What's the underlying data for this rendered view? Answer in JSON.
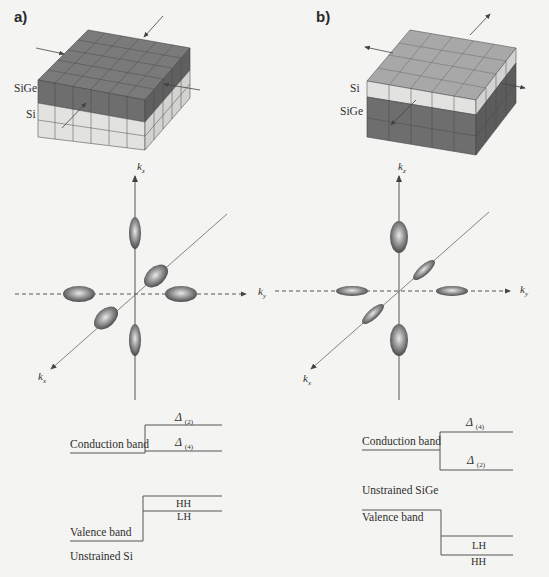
{
  "figure": {
    "panels": [
      {
        "id": "a",
        "label": "a)",
        "structure": {
          "layers_top_to_bottom": [
            "SiGe",
            "Si"
          ],
          "layer_labels": {
            "upper": "SiGe",
            "lower": "Si"
          },
          "strain_arrows": "compressive (pointing inward)"
        },
        "k_space": {
          "axes": {
            "kz": "k",
            "kz_sub": "z",
            "ky": "k",
            "ky_sub": "y",
            "kx": "k",
            "kx_sub": "x"
          },
          "valleys": {
            "kz": "small (elongated along kz)",
            "kx_ky": "large (in-plane)"
          }
        },
        "bands": {
          "conduction_label": "Conduction band",
          "delta_upper": {
            "symbol": "Δ",
            "sub": "(2)"
          },
          "delta_lower": {
            "symbol": "Δ",
            "sub": "(4)"
          },
          "valence_label": "Valence band",
          "hh_label": "HH",
          "lh_label": "LH",
          "reference_label": "Unstrained Si"
        }
      },
      {
        "id": "b",
        "label": "b)",
        "structure": {
          "layers_top_to_bottom": [
            "Si",
            "SiGe"
          ],
          "layer_labels": {
            "upper": "Si",
            "lower": "SiGe"
          },
          "strain_arrows": "tensile (pointing outward)"
        },
        "k_space": {
          "axes": {
            "kz": "k",
            "kz_sub": "z",
            "ky": "k",
            "ky_sub": "y",
            "kx": "k",
            "kx_sub": "x"
          },
          "valleys": {
            "kz": "large (along kz)",
            "kx_ky": "small (in-plane)"
          }
        },
        "bands": {
          "conduction_label": "Conduction band",
          "delta_upper": {
            "symbol": "Δ",
            "sub": "(4)"
          },
          "delta_lower": {
            "symbol": "Δ",
            "sub": "(2)"
          },
          "reference_label": "Unstrained SiGe",
          "valence_label": "Valence band",
          "lh_label": "LH",
          "hh_label": "HH"
        }
      }
    ],
    "colors": {
      "background": "#f4f4f2",
      "sige_face": "#6f6f6f",
      "sige_top": "#7a7a7a",
      "si_face": "#e4e4e2",
      "si_top_b": "#a9a9a9",
      "line": "#555555"
    }
  }
}
